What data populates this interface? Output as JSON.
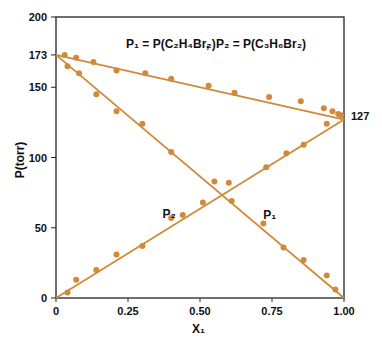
{
  "chart_data": {
    "type": "scatter",
    "title": "",
    "annotation": {
      "p1": "P₁ = P(C₂H₄Br₂)",
      "sep": ",",
      "p2": "P₂ = P(C₃H₆Br₂)"
    },
    "xlabel": "X₁",
    "ylabel": "P(torr)",
    "xlim": [
      0,
      1.0
    ],
    "ylim": [
      0,
      200
    ],
    "xticks": [
      "0",
      "0.25",
      "0.50",
      "0.75",
      "1.00"
    ],
    "xtick_values": [
      0,
      0.25,
      0.5,
      0.75,
      1.0
    ],
    "yticks": [
      "0",
      "50",
      "100",
      "150",
      "173",
      "200"
    ],
    "ytick_values": [
      0,
      50,
      100,
      150,
      173,
      200
    ],
    "right_label": "127",
    "color": "#d08a3a",
    "series": [
      {
        "name": "P total",
        "line": [
          [
            0,
            173
          ],
          [
            1,
            127
          ]
        ],
        "points": [
          [
            0.03,
            173
          ],
          [
            0.07,
            171
          ],
          [
            0.13,
            168
          ],
          [
            0.21,
            162
          ],
          [
            0.31,
            160
          ],
          [
            0.4,
            156
          ],
          [
            0.53,
            151
          ],
          [
            0.62,
            146
          ],
          [
            0.74,
            143
          ],
          [
            0.85,
            140
          ],
          [
            0.93,
            135
          ],
          [
            0.96,
            133
          ],
          [
            0.98,
            131
          ]
        ]
      },
      {
        "name": "P1",
        "label": "P₁",
        "label_at": [
          0.72,
          56
        ],
        "line": [
          [
            0,
            173
          ],
          [
            1,
            0
          ]
        ],
        "points": [
          [
            0.04,
            165
          ],
          [
            0.08,
            160
          ],
          [
            0.14,
            145
          ],
          [
            0.21,
            133
          ],
          [
            0.3,
            124
          ],
          [
            0.4,
            104
          ],
          [
            0.55,
            83
          ],
          [
            0.61,
            69
          ],
          [
            0.72,
            53
          ],
          [
            0.79,
            36
          ],
          [
            0.86,
            27
          ],
          [
            0.94,
            16
          ],
          [
            0.97,
            6
          ]
        ]
      },
      {
        "name": "P2",
        "label": "P₂",
        "label_at": [
          0.37,
          57
        ],
        "line": [
          [
            0,
            0
          ],
          [
            1,
            127
          ]
        ],
        "points": [
          [
            0.04,
            4
          ],
          [
            0.07,
            13
          ],
          [
            0.14,
            20
          ],
          [
            0.21,
            31
          ],
          [
            0.3,
            37
          ],
          [
            0.4,
            57
          ],
          [
            0.44,
            59
          ],
          [
            0.51,
            68
          ],
          [
            0.6,
            82
          ],
          [
            0.73,
            93
          ],
          [
            0.8,
            103
          ],
          [
            0.86,
            109
          ],
          [
            0.94,
            124
          ],
          [
            0.99,
            130
          ]
        ]
      }
    ]
  }
}
